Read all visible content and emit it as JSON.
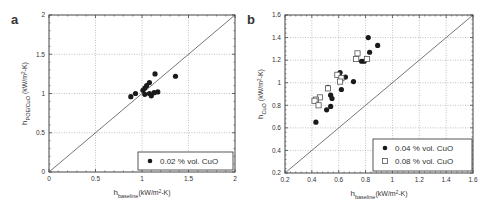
{
  "chart_data": [
    {
      "type": "scatter",
      "panel_label": "a",
      "title": "",
      "xlabel": "h_baseline (kW/m²-K)",
      "xlabel_main": "h",
      "xlabel_sub": "baseline",
      "xlabel_unit": "(kW/m",
      "xlabel_unit_tail": "-K)",
      "ylabel": "h_POE/CuO (kW/m²-K)",
      "ylabel_main": "h",
      "ylabel_sub": "POE/CuO",
      "ylabel_unit": "(kW/m",
      "ylabel_unit_tail": "-K)",
      "xlim": [
        0,
        2
      ],
      "ylim": [
        0,
        2
      ],
      "xticks": [
        0,
        0.5,
        1,
        1.5,
        2
      ],
      "yticks": [
        0,
        0.5,
        1,
        1.5,
        2
      ],
      "xtick_labels": [
        "0",
        "0.5",
        "1",
        "1.5",
        "2"
      ],
      "ytick_labels": [
        "0",
        "0.5",
        "1",
        "1.5",
        "2"
      ],
      "grid": true,
      "reference_line": "y = x",
      "legend_position": "lower right",
      "series": [
        {
          "name": "0.02 % vol. CuO",
          "marker": "filled-circle",
          "color": "#1a1a1a",
          "points": [
            [
              0.88,
              0.96
            ],
            [
              0.93,
              1.0
            ],
            [
              1.01,
              1.04
            ],
            [
              1.03,
              1.07
            ],
            [
              1.05,
              1.1
            ],
            [
              1.08,
              1.14
            ],
            [
              1.14,
              1.25
            ],
            [
              1.36,
              1.22
            ],
            [
              1.03,
              0.99
            ],
            [
              1.08,
              1.0
            ],
            [
              1.1,
              0.97
            ],
            [
              1.13,
              1.01
            ],
            [
              1.17,
              1.02
            ]
          ]
        }
      ]
    },
    {
      "type": "scatter",
      "panel_label": "b",
      "title": "",
      "xlabel": "h_baseline (kW/m²-K)",
      "xlabel_main": "h",
      "xlabel_sub": "baseline",
      "xlabel_unit": "(kW/m",
      "xlabel_unit_tail": "-K)",
      "ylabel": "h_CuO (kW/m²-K)",
      "ylabel_main": "h",
      "ylabel_sub": "CuO",
      "ylabel_unit": "(kW/m",
      "ylabel_unit_tail": "-K)",
      "xlim": [
        0.2,
        1.6
      ],
      "ylim": [
        0.2,
        1.6
      ],
      "xticks": [
        0.2,
        0.4,
        0.6,
        0.8,
        1.0,
        1.2,
        1.4,
        1.6
      ],
      "yticks": [
        0.2,
        0.4,
        0.6,
        0.8,
        1.0,
        1.2,
        1.4,
        1.6
      ],
      "xtick_labels": [
        "0.2",
        "0.4",
        "0.6",
        "0.8",
        "1",
        "1.2",
        "1.4",
        "1.6"
      ],
      "ytick_labels": [
        "0.2",
        "0.4",
        "0.6",
        "0.8",
        "1",
        "1.2",
        "1.4",
        "1.6"
      ],
      "grid": true,
      "reference_line": "y = x",
      "legend_position": "lower right",
      "series": [
        {
          "name": "0.04 % vol. CuO",
          "marker": "filled-circle",
          "color": "#1a1a1a",
          "points": [
            [
              0.82,
              1.4
            ],
            [
              0.89,
              1.33
            ],
            [
              0.83,
              1.27
            ],
            [
              0.77,
              1.19
            ],
            [
              0.61,
              1.09
            ],
            [
              0.65,
              1.05
            ],
            [
              0.71,
              1.01
            ],
            [
              0.62,
              0.94
            ],
            [
              0.52,
              0.96
            ],
            [
              0.54,
              0.89
            ],
            [
              0.55,
              0.86
            ],
            [
              0.54,
              0.79
            ],
            [
              0.51,
              0.76
            ],
            [
              0.43,
              0.65
            ],
            [
              0.79,
              1.19
            ]
          ]
        },
        {
          "name": "0.08 % vol. CuO",
          "marker": "open-square",
          "color": "#555555",
          "points": [
            [
              0.74,
              1.26
            ],
            [
              0.73,
              1.21
            ],
            [
              0.81,
              1.21
            ],
            [
              0.59,
              1.07
            ],
            [
              0.62,
              1.04
            ],
            [
              0.61,
              1.01
            ],
            [
              0.52,
              0.95
            ],
            [
              0.46,
              0.87
            ],
            [
              0.43,
              0.85
            ],
            [
              0.42,
              0.84
            ],
            [
              0.45,
              0.8
            ]
          ]
        }
      ]
    }
  ]
}
